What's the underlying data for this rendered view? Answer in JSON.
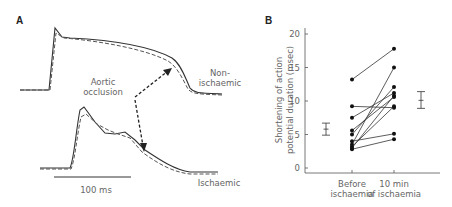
{
  "panel_a": {
    "label": "A",
    "annotation": [
      "Aortic",
      "occlusion"
    ],
    "trace_labels": {
      "non_ischaemic": [
        "Non-",
        "ischaemic"
      ],
      "ischaemic": "Ischaemic"
    },
    "scale_bar": "100 ms"
  },
  "panel_b": {
    "label": "B",
    "ylabel_lines": [
      "Shortening of action",
      "potential duration (msec)"
    ],
    "yticks": [
      "0",
      "5",
      "10",
      "15",
      "20"
    ],
    "xticks": [
      [
        "Before",
        "ischaemia"
      ],
      [
        "10 min",
        "of ischaemia"
      ]
    ]
  },
  "chart_data": [
    {
      "type": "line",
      "title": "A",
      "description": "Action potential traces before (solid) and after (dashed) aortic occlusion; top = non-ischaemic, bottom = ischaemic",
      "series": [
        {
          "name": "Non-ischaemic",
          "style": "solid vs dashed overlay"
        },
        {
          "name": "Ischaemic",
          "style": "solid vs dashed overlay"
        }
      ],
      "annotations": [
        "Aortic occlusion",
        "Non-ischaemic",
        "Ischaemic",
        "100 ms"
      ]
    },
    {
      "type": "scatter",
      "title": "B",
      "xlabel": "",
      "ylabel": "Shortening of action potential duration (msec)",
      "categories": [
        "Before ischaemia",
        "10 min of ischaemia"
      ],
      "ylim": [
        0,
        20
      ],
      "yticks": [
        0,
        5,
        10,
        15,
        20
      ],
      "paired_points": [
        [
          13.2,
          17.8
        ],
        [
          9.2,
          9.0
        ],
        [
          7.5,
          11.2
        ],
        [
          5.6,
          10.6
        ],
        [
          5.0,
          12.1
        ],
        [
          4.0,
          5.1
        ],
        [
          3.5,
          15.0
        ],
        [
          3.2,
          9.2
        ],
        [
          3.0,
          10.8
        ],
        [
          2.8,
          4.3
        ]
      ],
      "series": [
        {
          "name": "Before ischaemia",
          "values": [
            13.2,
            9.2,
            7.5,
            5.6,
            5.0,
            4.0,
            3.5,
            3.2,
            3.0,
            2.8
          ]
        },
        {
          "name": "10 min of ischaemia",
          "values": [
            17.8,
            9.0,
            11.2,
            10.6,
            12.1,
            5.1,
            15.0,
            9.2,
            10.8,
            4.3
          ]
        }
      ],
      "mean_sem": [
        {
          "category": "Before ischaemia",
          "mean": 5.8,
          "low": 4.9,
          "high": 6.7
        },
        {
          "category": "10 min of ischaemia",
          "mean": 10.1,
          "low": 8.9,
          "high": 11.4
        }
      ],
      "grid": false
    }
  ]
}
